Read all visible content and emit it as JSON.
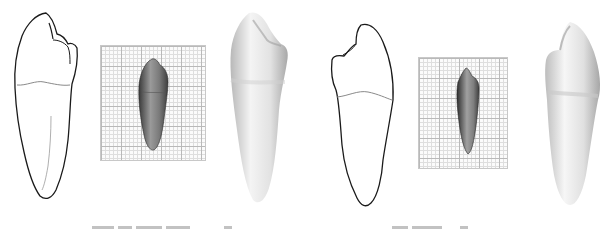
{
  "figure": {
    "panels": [
      {
        "id": "panel-1",
        "type": "line-drawing",
        "subject": "tooth-outline-view-a"
      },
      {
        "id": "panel-2",
        "type": "photo-on-grid",
        "subject": "tooth-specimen-view-a"
      },
      {
        "id": "panel-3",
        "type": "shaded-render",
        "subject": "tooth-render-view-a"
      },
      {
        "id": "panel-4",
        "type": "line-drawing",
        "subject": "tooth-outline-view-b"
      },
      {
        "id": "panel-5",
        "type": "photo-on-grid",
        "subject": "tooth-specimen-view-b"
      },
      {
        "id": "panel-6",
        "type": "shaded-render",
        "subject": "tooth-render-view-b"
      }
    ],
    "captions": [
      {
        "text": "",
        "note": "truncated, illegible"
      },
      {
        "text": "",
        "note": "truncated, illegible"
      }
    ],
    "colors": {
      "outline": "#1a1a1a",
      "cej_line": "#8a8a8a",
      "grid_major": "#b9b9b9",
      "grid_minor": "#dedede",
      "render_light": "#f4f4f4",
      "render_dark": "#a8a8a8"
    }
  }
}
